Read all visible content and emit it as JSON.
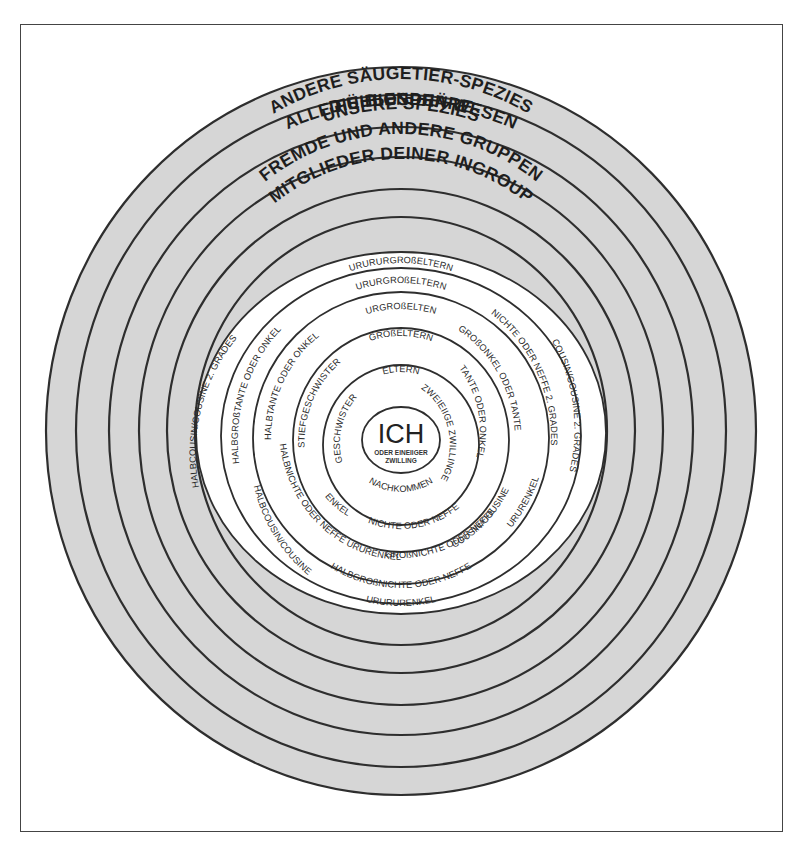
{
  "diagram": {
    "colors": {
      "band_fill": "#d6d6d6",
      "line": "#2e2e2e",
      "inner_fill": "#ffffff",
      "frame": "#444444"
    },
    "outer_rings": [
      {
        "label": "DIE BIOSPHÄRE"
      },
      {
        "label": "ALLE FÜHLENDEN WESEN"
      },
      {
        "label": "ANDERE SÄUGETIER-SPEZIES"
      },
      {
        "label": "UNSERE SPEZIES"
      },
      {
        "label": "FREMDE UND ANDERE GRUPPEN"
      },
      {
        "label": "MITGLIEDER DEINER INGROUP"
      }
    ],
    "center": {
      "label": "ICH",
      "sublabel_line1": "ODER EINEIIGER",
      "sublabel_line2": "ZWILLING"
    },
    "inner_rings": {
      "ring1": {
        "top": "ELTERN",
        "right": "ZWEIEIIGE ZWILLINGE",
        "bottom": "NACHKOMMEN",
        "left": "GESCHWISTER"
      },
      "ring2": {
        "top": "GROßELTERN",
        "right": "TANTE ODER ONKEL",
        "bottom": "NICHTE ODER NEFFE",
        "left": "STIEFGESCHWISTER",
        "lower_left": "ENKEL"
      },
      "ring3": {
        "top": "URGROßELTEN",
        "right": "GROßONKEL ODER TANTE",
        "lower_right": "COUSIN/COUSINE",
        "bottom": "GROßNICHTE ODER NEFFE",
        "left": "HALBTANTE ODER ONKEL",
        "lower_left": "HALBNICHTE ODER NEFFE URURENKEL"
      },
      "ring4": {
        "top": "URURGROßELTERN",
        "right": "NICHTE ODER NEFFE 2. GRADES",
        "lower_right": "URURENKEL",
        "bottom": "HALBGROßNICHTE ODER NEFFE",
        "left": "HALBGROßTANTE ODER ONKEL",
        "lower_left": "HALBCOUSIN/COUSINE"
      },
      "ring5": {
        "top": "URURURGROßELTERN",
        "right": "COUSIN/COUSINE 2. GRADES",
        "bottom": "URURURENKEL",
        "left": "HALBCOUSIN/COUSINE 2. GRADES"
      }
    }
  }
}
